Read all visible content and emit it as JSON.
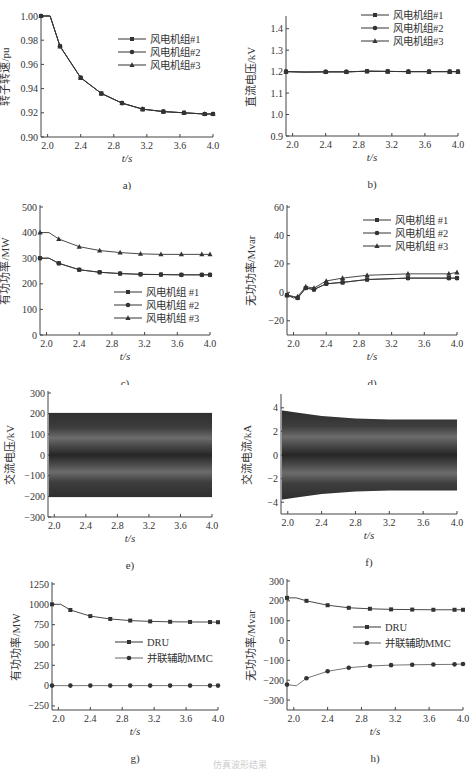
{
  "figure": {
    "caption": "仿真波形结果"
  },
  "chart_data": [
    {
      "id": "a",
      "panel_label": "a)",
      "type": "line",
      "title": "",
      "xlabel": "t/s",
      "ylabel": "转子转速/pu",
      "xlim": [
        1.92,
        4.0
      ],
      "ylim": [
        0.9,
        1.0
      ],
      "xticks": [
        "2.0",
        "2.4",
        "2.8",
        "3.2",
        "3.6",
        "4.0"
      ],
      "yticks": [
        "0.90",
        "0.92",
        "0.94",
        "0.96",
        "0.98",
        "1.00"
      ],
      "legend": [
        "风电机组#1",
        "风电机组#2",
        "风电机组#3"
      ],
      "legend_position": "upper right",
      "x": [
        1.92,
        2.03,
        2.15,
        2.4,
        2.65,
        2.9,
        3.15,
        3.4,
        3.65,
        3.9,
        4.0
      ],
      "series": [
        {
          "name": "风电机组#1",
          "marker": "square",
          "values": [
            1.0,
            1.0,
            0.975,
            0.949,
            0.936,
            0.928,
            0.923,
            0.921,
            0.92,
            0.919,
            0.919
          ]
        },
        {
          "name": "风电机组#2",
          "marker": "circle",
          "values": [
            1.0,
            1.0,
            0.975,
            0.949,
            0.936,
            0.928,
            0.923,
            0.921,
            0.92,
            0.919,
            0.919
          ]
        },
        {
          "name": "风电机组#3",
          "marker": "triangle",
          "values": [
            1.0,
            1.0,
            0.975,
            0.949,
            0.936,
            0.928,
            0.923,
            0.921,
            0.92,
            0.919,
            0.919
          ]
        }
      ]
    },
    {
      "id": "b",
      "panel_label": "b)",
      "type": "line",
      "title": "",
      "xlabel": "t/s",
      "ylabel": "直流电压/kV",
      "xlim": [
        1.92,
        4.0
      ],
      "ylim": [
        0.9,
        1.45
      ],
      "xticks": [
        "2.0",
        "2.4",
        "2.8",
        "3.2",
        "3.6",
        "4.0"
      ],
      "yticks": [
        "0.9",
        "1.0",
        "1.1",
        "1.2",
        "1.3",
        "1.4"
      ],
      "legend": [
        "风电机组#1",
        "风电机组#2",
        "风电机组#3"
      ],
      "legend_position": "upper right",
      "x": [
        1.92,
        2.15,
        2.4,
        2.65,
        2.9,
        3.15,
        3.4,
        3.65,
        3.9,
        4.0
      ],
      "series": [
        {
          "name": "风电机组#1",
          "marker": "square",
          "values": [
            1.2,
            1.198,
            1.199,
            1.199,
            1.202,
            1.201,
            1.2,
            1.2,
            1.2,
            1.2
          ]
        },
        {
          "name": "风电机组#2",
          "marker": "circle",
          "values": [
            1.2,
            1.198,
            1.199,
            1.199,
            1.202,
            1.201,
            1.2,
            1.2,
            1.2,
            1.2
          ]
        },
        {
          "name": "风电机组#3",
          "marker": "triangle",
          "values": [
            1.2,
            1.198,
            1.199,
            1.199,
            1.202,
            1.201,
            1.2,
            1.2,
            1.2,
            1.2
          ]
        }
      ]
    },
    {
      "id": "c",
      "panel_label": "c)",
      "type": "line",
      "title": "",
      "xlabel": "t/s",
      "ylabel": "有功功率/MW",
      "xlim": [
        1.92,
        4.0
      ],
      "ylim": [
        0,
        500
      ],
      "xticks": [
        "2.0",
        "2.4",
        "2.8",
        "3.2",
        "3.6",
        "4.0"
      ],
      "yticks": [
        "0",
        "100",
        "200",
        "300",
        "400",
        "500"
      ],
      "legend": [
        "风电机组 #1",
        "风电机组 #2",
        "风电机组 #3"
      ],
      "legend_position": "lower right",
      "x": [
        1.92,
        2.03,
        2.15,
        2.4,
        2.65,
        2.9,
        3.15,
        3.4,
        3.65,
        3.9,
        4.0
      ],
      "series": [
        {
          "name": "风电机组 #1",
          "marker": "square",
          "values": [
            300,
            300,
            280,
            255,
            245,
            240,
            237,
            236,
            235,
            235,
            235
          ]
        },
        {
          "name": "风电机组 #2",
          "marker": "circle",
          "values": [
            300,
            300,
            280,
            255,
            245,
            240,
            237,
            236,
            235,
            235,
            235
          ]
        },
        {
          "name": "风电机组 #3",
          "marker": "triangle",
          "values": [
            400,
            400,
            375,
            345,
            330,
            322,
            317,
            315,
            315,
            315,
            315
          ]
        }
      ]
    },
    {
      "id": "d",
      "panel_label": "d)",
      "type": "line",
      "title": "",
      "xlabel": "t/s",
      "ylabel": "无功功率/Mvar",
      "xlim": [
        1.92,
        4.0
      ],
      "ylim": [
        -30,
        60
      ],
      "xticks": [
        "2.0",
        "2.4",
        "2.8",
        "3.2",
        "3.6",
        "4.0"
      ],
      "yticks": [
        "-20",
        "0",
        "20",
        "40",
        "60"
      ],
      "legend": [
        "风电机组 #1",
        "风电机组 #2",
        "风电机组 #3"
      ],
      "legend_position": "upper right",
      "x": [
        1.92,
        2.0,
        2.05,
        2.15,
        2.25,
        2.4,
        2.6,
        2.9,
        3.4,
        3.9,
        4.0
      ],
      "series": [
        {
          "name": "风电机组 #1",
          "marker": "square",
          "values": [
            -2,
            -3,
            -4,
            3,
            2,
            6,
            7,
            9,
            10,
            10,
            10
          ]
        },
        {
          "name": "风电机组 #2",
          "marker": "circle",
          "values": [
            -2,
            -3,
            -4,
            3,
            2,
            6,
            7,
            9,
            10,
            10,
            10
          ]
        },
        {
          "name": "风电机组 #3",
          "marker": "triangle",
          "values": [
            -2,
            -4,
            -3,
            4,
            3,
            8,
            10,
            12,
            13,
            13,
            14
          ]
        }
      ]
    },
    {
      "id": "e",
      "panel_label": "e)",
      "type": "line",
      "title": "",
      "xlabel": "t/s",
      "ylabel": "交流电压/kV",
      "xlim": [
        1.92,
        4.0
      ],
      "ylim": [
        -300,
        300
      ],
      "xticks": [
        "2.0",
        "2.4",
        "2.8",
        "3.2",
        "3.6",
        "4.0"
      ],
      "yticks": [
        "-300",
        "-200",
        "-100",
        "0",
        "100",
        "200",
        "300"
      ],
      "description": "Dense three-phase AC oscillation, envelope ±200 kV constant",
      "envelope": {
        "x": [
          1.92,
          4.0
        ],
        "upper": [
          205,
          205
        ],
        "lower": [
          -205,
          -205
        ]
      }
    },
    {
      "id": "f",
      "panel_label": "f)",
      "type": "line",
      "title": "",
      "xlabel": "t/s",
      "ylabel": "交流电流/kA",
      "xlim": [
        1.92,
        4.0
      ],
      "ylim": [
        -5,
        5
      ],
      "xticks": [
        "2.0",
        "2.4",
        "2.8",
        "3.2",
        "3.6",
        "4.0"
      ],
      "yticks": [
        "-4",
        "-2",
        "0",
        "2",
        "4"
      ],
      "description": "Dense three-phase AC current oscillation, envelope decays from ±3.8 kA to ±3.0 kA",
      "envelope": {
        "x": [
          1.92,
          2.1,
          2.4,
          2.8,
          3.2,
          3.6,
          4.0
        ],
        "upper": [
          3.8,
          3.6,
          3.3,
          3.1,
          3.0,
          3.0,
          3.0
        ],
        "lower": [
          -3.8,
          -3.6,
          -3.3,
          -3.1,
          -3.0,
          -3.0,
          -3.0
        ]
      }
    },
    {
      "id": "g",
      "panel_label": "g)",
      "type": "line",
      "title": "",
      "xlabel": "t/s",
      "ylabel": "有功功率/MW",
      "xlim": [
        1.92,
        4.0
      ],
      "ylim": [
        -300,
        1250
      ],
      "xticks": [
        "2.0",
        "2.4",
        "2.8",
        "3.2",
        "3.6",
        "4.0"
      ],
      "yticks": [
        "-250",
        "0",
        "250",
        "500",
        "750",
        "1000",
        "1250"
      ],
      "legend": [
        "DRU",
        "并联辅助MMC"
      ],
      "legend_position": "center right",
      "x": [
        1.92,
        2.03,
        2.15,
        2.4,
        2.65,
        2.9,
        3.15,
        3.4,
        3.65,
        3.9,
        4.0
      ],
      "series": [
        {
          "name": "DRU",
          "marker": "square",
          "values": [
            1000,
            1000,
            930,
            855,
            820,
            800,
            790,
            785,
            783,
            782,
            780
          ]
        },
        {
          "name": "并联辅助MMC",
          "marker": "circle",
          "values": [
            0,
            0,
            0,
            0,
            0,
            0,
            0,
            0,
            0,
            0,
            0
          ]
        }
      ]
    },
    {
      "id": "h",
      "panel_label": "h)",
      "type": "line",
      "title": "",
      "xlabel": "t/s",
      "ylabel": "无功功率/Mvar",
      "xlim": [
        1.92,
        4.0
      ],
      "ylim": [
        -350,
        300
      ],
      "xticks": [
        "2.0",
        "2.4",
        "2.8",
        "3.2",
        "3.6",
        "4.0"
      ],
      "yticks": [
        "-300",
        "-200",
        "-100",
        "0",
        "100",
        "200",
        "300"
      ],
      "legend": [
        "DRU",
        "并联辅助MMC"
      ],
      "legend_position": "center right",
      "x": [
        1.92,
        2.03,
        2.15,
        2.4,
        2.65,
        2.9,
        3.15,
        3.4,
        3.65,
        3.9,
        4.0
      ],
      "series": [
        {
          "name": "DRU",
          "marker": "square",
          "values": [
            215,
            215,
            200,
            178,
            165,
            160,
            157,
            156,
            155,
            155,
            155
          ]
        },
        {
          "name": "并联辅助MMC",
          "marker": "circle",
          "values": [
            -222,
            -228,
            -190,
            -155,
            -137,
            -128,
            -124,
            -122,
            -121,
            -120,
            -118
          ]
        }
      ]
    }
  ]
}
